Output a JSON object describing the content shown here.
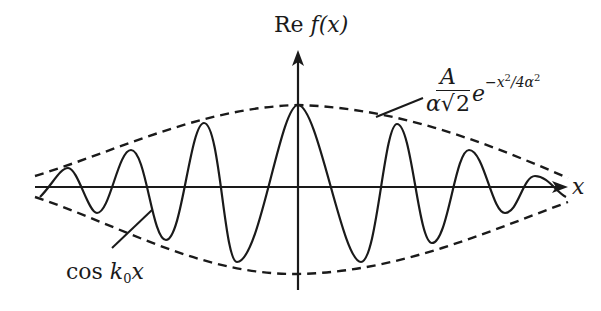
{
  "figure": {
    "y_axis_label_prefix": "Re",
    "y_axis_label_func": "f(x)",
    "x_axis_label": "x",
    "carrier_label_prefix": "cos",
    "carrier_label_k": "k",
    "carrier_label_sub": "0",
    "carrier_label_var": "x",
    "envelope_numerator": "A",
    "envelope_den_alpha": "α",
    "envelope_den_sqrt_sym": "√",
    "envelope_den_sqrt_arg": "2",
    "envelope_exp_base": "e",
    "envelope_exp_text": "−x",
    "envelope_exp_sq1": "2",
    "envelope_exp_mid": "/4α",
    "envelope_exp_sq2": "2"
  },
  "colors": {
    "ink": "#1a1a1a",
    "background": "#ffffff"
  },
  "geometry": {
    "origin": [
      298,
      187
    ],
    "x_axis_range": [
      35,
      568
    ],
    "y_axis_range": [
      50,
      290
    ],
    "envelope_peak_amplitude_px": 82,
    "carrier_extrema": [
      [
        40,
        197
      ],
      [
        68,
        168
      ],
      [
        97,
        213
      ],
      [
        131,
        150
      ],
      [
        166,
        240
      ],
      [
        204,
        123
      ],
      [
        237,
        262
      ],
      [
        298,
        105
      ],
      [
        361,
        262
      ],
      [
        397,
        124
      ],
      [
        432,
        243
      ],
      [
        469,
        150
      ],
      [
        505,
        213
      ],
      [
        535,
        176
      ],
      [
        566,
        197
      ]
    ]
  }
}
